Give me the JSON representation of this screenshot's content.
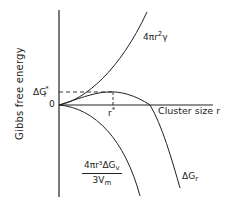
{
  "diagram": {
    "y_axis_label": "Gibbs free energy",
    "x_axis_label": "Cluster size r",
    "origin_label": "0",
    "critical_energy_label": {
      "main": "ΔG",
      "sub": "r",
      "sup": "*"
    },
    "critical_radius_label": {
      "main": "r",
      "sup": "*"
    },
    "curves": [
      {
        "name": "surface-term",
        "label": {
          "main": "4πr",
          "sup": "2",
          "tail": "γ"
        },
        "shape": "rising parabola"
      },
      {
        "name": "volume-term",
        "label": {
          "numerator": "4πr³ΔG",
          "numerator_sub": "v",
          "denominator": "3V",
          "denominator_sub": "m"
        },
        "shape": "falling cubic"
      },
      {
        "name": "total-energy",
        "label": {
          "main": "ΔG",
          "sub": "r"
        },
        "shape": "rises to maximum at r*, then falls"
      }
    ],
    "line_color": "#222222",
    "background": "#ffffff"
  }
}
